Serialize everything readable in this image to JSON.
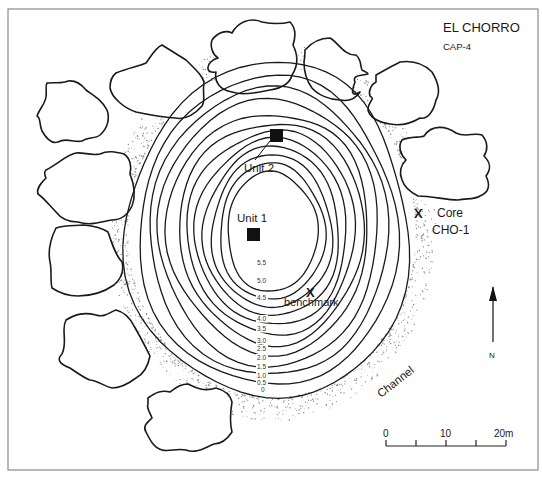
{
  "title": "EL CHORRO",
  "subtitle": "CAP-4",
  "labels": {
    "unit1": "Unit 1",
    "unit2": "Unit 2",
    "core_line1": "Core",
    "core_line2": "CHO-1",
    "benchmark": "benchmark",
    "channel": "Channel",
    "north": "N",
    "x_mark": "X"
  },
  "contours": [
    "5.5",
    "5.0",
    "4.5",
    "4.0",
    "3.5",
    "3.0",
    "2.5",
    "2.0",
    "1.5",
    "1.0",
    "0.5",
    "0"
  ],
  "scale_bar": {
    "ticks": [
      "0",
      "10",
      "20m"
    ]
  },
  "colors": {
    "line": "#1a1a1a",
    "stipple": "#8c8c8c",
    "frame": "#8a8a8a",
    "background": "#ffffff"
  }
}
